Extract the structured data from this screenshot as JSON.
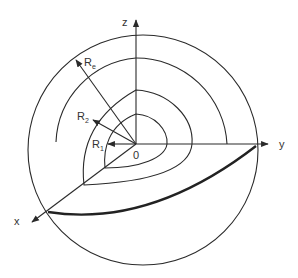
{
  "diagram": {
    "type": "spherical shells with 3D coordinate axes",
    "axes": {
      "x": {
        "label": "x"
      },
      "y": {
        "label": "y"
      },
      "z": {
        "label": "z"
      }
    },
    "origin_label": "0",
    "radii": [
      {
        "base": "R",
        "sub": "1"
      },
      {
        "base": "R",
        "sub": "2"
      },
      {
        "base": "R",
        "sub": "e"
      }
    ],
    "colors": {
      "stroke": "#2a2a2a",
      "background": "#ffffff"
    }
  }
}
